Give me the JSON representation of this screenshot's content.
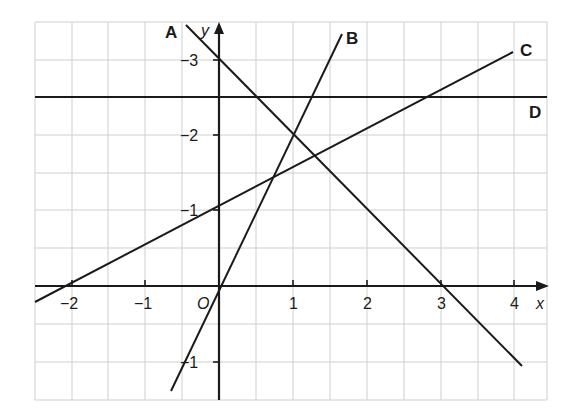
{
  "diagram": {
    "type": "coordinate-graph",
    "axes": {
      "x_label": "x",
      "y_label": "y",
      "origin_label": "O",
      "x_ticks": [
        {
          "value": -2,
          "label": "−2"
        },
        {
          "value": -1,
          "label": "−1"
        },
        {
          "value": 1,
          "label": "1"
        },
        {
          "value": 2,
          "label": "2"
        },
        {
          "value": 3,
          "label": "3"
        },
        {
          "value": 4,
          "label": "4"
        }
      ],
      "y_ticks": [
        {
          "value": -1,
          "label": "−1"
        },
        {
          "value": 1,
          "label": "−1"
        },
        {
          "value": 2,
          "label": "−2"
        },
        {
          "value": 3,
          "label": "−3"
        }
      ],
      "x_range": [
        -2.5,
        4.4
      ],
      "y_range": [
        -1.5,
        3.5
      ],
      "grid_step": 0.5
    },
    "lines": [
      {
        "name": "A",
        "equation": "y = 3 - x",
        "label": "A"
      },
      {
        "name": "B",
        "equation": "y = 3x",
        "label": "B"
      },
      {
        "name": "C",
        "equation": "y = 0.5x + 1",
        "label": "C"
      },
      {
        "name": "D",
        "equation": "y = 2.5",
        "label": "D"
      }
    ],
    "colors": {
      "line": "#1a1a1a",
      "grid": "#cfcfcf",
      "background": "#ffffff"
    }
  }
}
